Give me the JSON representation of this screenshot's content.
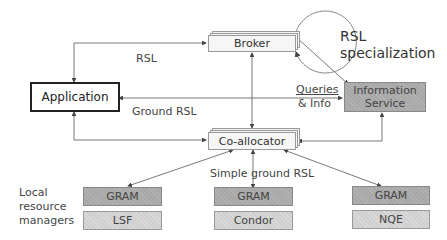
{
  "diagram": {
    "nodes": {
      "application": "Application",
      "broker": "Broker",
      "coallocator": "Co-allocator",
      "info_service_line1": "Information",
      "info_service_line2": "Service",
      "gram_lsf": "GRAM",
      "lsf": "LSF",
      "gram_condor": "GRAM",
      "condor": "Condor",
      "gram_nqe": "GRAM",
      "nqe": "NQE"
    },
    "labels": {
      "rsl": "RSL",
      "ground_rsl": "Ground RSL",
      "queries": "Queries",
      "and_info": "& Info",
      "rsl_specialization_line1": "RSL",
      "rsl_specialization_line2": "specialization",
      "simple_ground_rsl": "Simple ground RSL",
      "local_line1": "Local",
      "local_line2": "resource",
      "local_line3": "managers"
    },
    "colors": {
      "dark_box": "#a8a8a8",
      "light_box": "#cfcfcf",
      "line": "#555555"
    }
  }
}
